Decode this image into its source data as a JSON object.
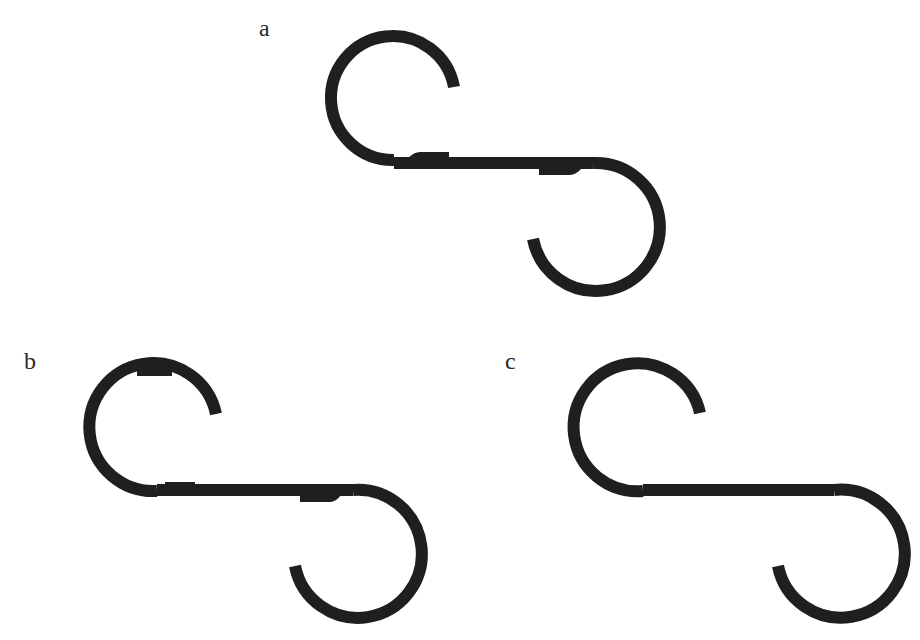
{
  "figure": {
    "panels": [
      {
        "id": "a",
        "label": "a",
        "description": "S-hook assembled from two arcs joined to a straight bar, with visible overlapping joint tabs",
        "joints_visible": true,
        "upper_arc": {
          "center": [
            394,
            98
          ],
          "radius": 62
        },
        "lower_arc": {
          "center": [
            593,
            227
          ],
          "radius": 64
        },
        "bar": {
          "y": 163,
          "x_start": 394,
          "x_end": 593
        }
      },
      {
        "id": "b",
        "label": "b",
        "description": "S-hook with joint tabs on the bar and an additional tab on the upper arc",
        "joints_visible": true,
        "upper_arc": {
          "center": [
            157,
            427
          ],
          "radius": 64
        },
        "lower_arc": {
          "center": [
            353,
            554
          ],
          "radius": 64
        },
        "bar": {
          "y": 490,
          "x_start": 157,
          "x_end": 353
        }
      },
      {
        "id": "c",
        "label": "c",
        "description": "Smooth continuous S-hook with no visible joints",
        "joints_visible": false,
        "upper_arc": {
          "center": [
            643,
            427
          ],
          "radius": 64
        },
        "lower_arc": {
          "center": [
            834,
            554
          ],
          "radius": 64
        },
        "bar": {
          "y": 490,
          "x_start": 643,
          "x_end": 834
        }
      }
    ],
    "stroke_color": "#1f1f1f",
    "background_color": "#ffffff"
  },
  "caption": ""
}
